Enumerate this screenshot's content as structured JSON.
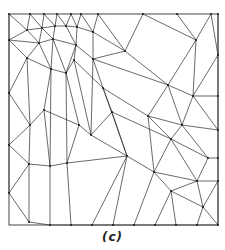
{
  "figure": {
    "caption": "(c)",
    "type": "triangular-mesh",
    "colors": {
      "edge": "#2a2a2a",
      "background": "#ffffff"
    },
    "bounds": {
      "x0": 9,
      "y0": 14,
      "x1": 218,
      "y1": 225
    },
    "vertices": [
      [
        9,
        14
      ],
      [
        30,
        14
      ],
      [
        44,
        14
      ],
      [
        57,
        14
      ],
      [
        71,
        14
      ],
      [
        81,
        14
      ],
      [
        98,
        14
      ],
      [
        143,
        14
      ],
      [
        177,
        14
      ],
      [
        211,
        14
      ],
      [
        218,
        14
      ],
      [
        27,
        30
      ],
      [
        42,
        28
      ],
      [
        55,
        26
      ],
      [
        66,
        26
      ],
      [
        77,
        27
      ],
      [
        93,
        32
      ],
      [
        125,
        51
      ],
      [
        196,
        40
      ],
      [
        218,
        55
      ],
      [
        9,
        40
      ],
      [
        39,
        43
      ],
      [
        53,
        39
      ],
      [
        76,
        45
      ],
      [
        93,
        59
      ],
      [
        168,
        85
      ],
      [
        193,
        96
      ],
      [
        218,
        96
      ],
      [
        27,
        58
      ],
      [
        51,
        69
      ],
      [
        66,
        73
      ],
      [
        74,
        60
      ],
      [
        103,
        88
      ],
      [
        148,
        116
      ],
      [
        182,
        125
      ],
      [
        218,
        130
      ],
      [
        9,
        93
      ],
      [
        30,
        125
      ],
      [
        44,
        110
      ],
      [
        79,
        125
      ],
      [
        91,
        135
      ],
      [
        171,
        139
      ],
      [
        208,
        158
      ],
      [
        218,
        158
      ],
      [
        9,
        145
      ],
      [
        29,
        164
      ],
      [
        50,
        166
      ],
      [
        67,
        163
      ],
      [
        112,
        112
      ],
      [
        127,
        156
      ],
      [
        154,
        172
      ],
      [
        197,
        181
      ],
      [
        218,
        181
      ],
      [
        9,
        193
      ],
      [
        29,
        222
      ],
      [
        50,
        225
      ],
      [
        71,
        225
      ],
      [
        92,
        225
      ],
      [
        113,
        225
      ],
      [
        134,
        225
      ],
      [
        155,
        225
      ],
      [
        176,
        225
      ],
      [
        197,
        225
      ],
      [
        218,
        225
      ],
      [
        171,
        191
      ],
      [
        203,
        207
      ]
    ],
    "edges": [
      [
        0,
        11
      ],
      [
        1,
        11
      ],
      [
        1,
        12
      ],
      [
        2,
        12
      ],
      [
        2,
        13
      ],
      [
        3,
        13
      ],
      [
        3,
        14
      ],
      [
        4,
        14
      ],
      [
        4,
        15
      ],
      [
        5,
        15
      ],
      [
        5,
        16
      ],
      [
        6,
        16
      ],
      [
        6,
        17
      ],
      [
        7,
        17
      ],
      [
        7,
        18
      ],
      [
        8,
        18
      ],
      [
        9,
        18
      ],
      [
        9,
        19
      ],
      [
        10,
        19
      ],
      [
        11,
        12
      ],
      [
        12,
        13
      ],
      [
        13,
        14
      ],
      [
        14,
        15
      ],
      [
        15,
        16
      ],
      [
        16,
        17
      ],
      [
        0,
        20
      ],
      [
        11,
        20
      ],
      [
        11,
        21
      ],
      [
        12,
        21
      ],
      [
        12,
        22
      ],
      [
        13,
        22
      ],
      [
        14,
        23
      ],
      [
        15,
        23
      ],
      [
        16,
        24
      ],
      [
        17,
        24
      ],
      [
        17,
        25
      ],
      [
        18,
        25
      ],
      [
        18,
        26
      ],
      [
        19,
        26
      ],
      [
        19,
        27
      ],
      [
        20,
        21
      ],
      [
        21,
        22
      ],
      [
        22,
        23
      ],
      [
        23,
        24
      ],
      [
        24,
        25
      ],
      [
        25,
        26
      ],
      [
        26,
        27
      ],
      [
        20,
        28
      ],
      [
        21,
        28
      ],
      [
        21,
        29
      ],
      [
        22,
        29
      ],
      [
        22,
        30
      ],
      [
        23,
        31
      ],
      [
        23,
        30
      ],
      [
        24,
        32
      ],
      [
        25,
        33
      ],
      [
        26,
        34
      ],
      [
        27,
        35
      ],
      [
        26,
        35
      ],
      [
        25,
        34
      ],
      [
        28,
        29
      ],
      [
        29,
        30
      ],
      [
        30,
        31
      ],
      [
        31,
        32
      ],
      [
        32,
        33
      ],
      [
        33,
        34
      ],
      [
        34,
        35
      ],
      [
        20,
        36
      ],
      [
        28,
        36
      ],
      [
        28,
        37
      ],
      [
        29,
        38
      ],
      [
        30,
        39
      ],
      [
        31,
        40
      ],
      [
        32,
        48
      ],
      [
        33,
        41
      ],
      [
        34,
        42
      ],
      [
        35,
        43
      ],
      [
        34,
        41
      ],
      [
        36,
        37
      ],
      [
        37,
        38
      ],
      [
        38,
        39
      ],
      [
        39,
        40
      ],
      [
        40,
        48
      ],
      [
        48,
        41
      ],
      [
        41,
        42
      ],
      [
        42,
        43
      ],
      [
        36,
        44
      ],
      [
        37,
        44
      ],
      [
        37,
        45
      ],
      [
        38,
        46
      ],
      [
        39,
        47
      ],
      [
        40,
        49
      ],
      [
        48,
        49
      ],
      [
        41,
        50
      ],
      [
        42,
        51
      ],
      [
        43,
        52
      ],
      [
        41,
        51
      ],
      [
        44,
        45
      ],
      [
        45,
        46
      ],
      [
        46,
        47
      ],
      [
        47,
        49
      ],
      [
        49,
        50
      ],
      [
        50,
        51
      ],
      [
        51,
        52
      ],
      [
        44,
        53
      ],
      [
        45,
        53
      ],
      [
        45,
        54
      ],
      [
        46,
        55
      ],
      [
        47,
        56
      ],
      [
        49,
        57
      ],
      [
        49,
        58
      ],
      [
        50,
        64
      ],
      [
        50,
        59
      ],
      [
        51,
        64
      ],
      [
        51,
        65
      ],
      [
        52,
        65
      ],
      [
        53,
        54
      ],
      [
        54,
        55
      ],
      [
        55,
        56
      ],
      [
        56,
        57
      ],
      [
        57,
        58
      ],
      [
        58,
        59
      ],
      [
        59,
        60
      ],
      [
        60,
        61
      ],
      [
        61,
        62
      ],
      [
        62,
        63
      ],
      [
        64,
        60
      ],
      [
        64,
        61
      ],
      [
        65,
        62
      ],
      [
        65,
        63
      ],
      [
        64,
        65
      ],
      [
        52,
        63
      ],
      [
        29,
        46
      ],
      [
        30,
        47
      ],
      [
        24,
        40
      ],
      [
        32,
        49
      ],
      [
        33,
        50
      ]
    ]
  }
}
